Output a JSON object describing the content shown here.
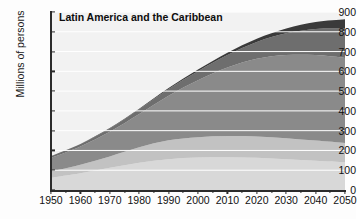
{
  "chart_data": {
    "type": "area",
    "stacked": true,
    "title": "Latin America and the Caribbean",
    "xlabel": "",
    "ylabel": "Millions of persons",
    "xlim": [
      1950,
      2050
    ],
    "ylim": [
      0,
      900
    ],
    "grid": true,
    "grid_color": "#ffffff",
    "legend_position": "none",
    "x": [
      1950,
      1960,
      1970,
      1980,
      1990,
      2000,
      2010,
      2020,
      2030,
      2040,
      2050
    ],
    "xticks": [
      "1950",
      "1960",
      "1970",
      "1980",
      "1990",
      "2000",
      "2010",
      "2020",
      "2030",
      "2040",
      "2050"
    ],
    "yticks": [
      "0",
      "100",
      "200",
      "300",
      "400",
      "500",
      "600",
      "700",
      "800",
      "900"
    ],
    "series": [
      {
        "name": "0-14",
        "color": "#d8d8d8",
        "values": [
          62,
          85,
          112,
          138,
          156,
          164,
          166,
          163,
          156,
          148,
          140
        ]
      },
      {
        "name": "15-24",
        "color": "#c2c2c2",
        "values": [
          32,
          43,
          58,
          78,
          95,
          103,
          107,
          108,
          106,
          102,
          98
        ]
      },
      {
        "name": "25-59",
        "color": "#8a8a8a",
        "values": [
          68,
          92,
          124,
          168,
          226,
          288,
          346,
          392,
          420,
          432,
          430
        ]
      },
      {
        "name": "60-79",
        "color": "#6e6e6e",
        "values": [
          9,
          12,
          17,
          24,
          34,
          46,
          63,
          85,
          110,
          132,
          148
        ]
      },
      {
        "name": "80+",
        "color": "#3a3a3a",
        "values": [
          1,
          1,
          2,
          3,
          5,
          8,
          12,
          17,
          25,
          35,
          47
        ]
      }
    ],
    "stack_totals": [
      172,
      233,
      313,
      411,
      516,
      609,
      694,
      765,
      817,
      849,
      863
    ]
  },
  "axis": {
    "ylabel_text": "Millions of persons"
  }
}
